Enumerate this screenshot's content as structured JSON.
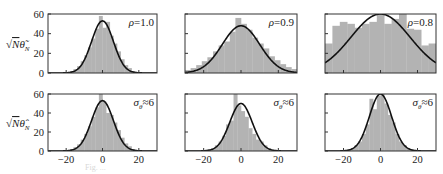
{
  "figure": {
    "ylabel_top": "√Nθ̃",
    "ylabel_top_sub": "N",
    "ylabel_bottom": "√Nθ̂",
    "ylabel_bottom_sub": "N",
    "yticks": [
      0,
      20,
      40,
      60
    ],
    "xticks": [
      -20,
      0,
      20
    ],
    "hist_color": "#b3b3b3",
    "curve_color": "#111111",
    "frame_color": "#333333"
  },
  "chart_data": [
    {
      "type": "bar",
      "title": "",
      "annotation": "ρ=1.0",
      "row": 0,
      "col": 0,
      "xlabel": "",
      "ylabel": "√N θ̃_N",
      "xlim": [
        -30,
        30
      ],
      "ylim": [
        0,
        60
      ],
      "show_xtick_labels": false,
      "bin_width": 2,
      "bin_centers": [
        -21,
        -19,
        -17,
        -15,
        -13,
        -11,
        -9,
        -7,
        -5,
        -3,
        -1,
        1,
        3,
        5,
        7,
        9,
        11,
        13,
        15,
        17,
        19,
        21
      ],
      "values": [
        0,
        1,
        2,
        4,
        7,
        12,
        18,
        26,
        35,
        45,
        58,
        46,
        52,
        38,
        30,
        22,
        14,
        8,
        5,
        2,
        1,
        0
      ],
      "fit_curve": {
        "type": "gaussian",
        "mean": 0,
        "sigma": 6,
        "peak": 53
      }
    },
    {
      "type": "bar",
      "annotation": "ρ=0.9",
      "row": 0,
      "col": 1,
      "xlim": [
        -30,
        30
      ],
      "ylim": [
        0,
        60
      ],
      "show_xtick_labels": false,
      "bin_width": 3,
      "bin_centers": [
        -28.5,
        -25.5,
        -22.5,
        -19.5,
        -16.5,
        -13.5,
        -10.5,
        -7.5,
        -4.5,
        -1.5,
        1.5,
        4.5,
        7.5,
        10.5,
        13.5,
        16.5,
        19.5,
        22.5,
        25.5,
        28.5
      ],
      "values": [
        3,
        5,
        8,
        12,
        16,
        22,
        28,
        32,
        42,
        56,
        50,
        44,
        36,
        30,
        25,
        17,
        13,
        9,
        6,
        4
      ],
      "fit_curve": {
        "type": "gaussian",
        "mean": 0,
        "sigma": 10,
        "peak": 48
      }
    },
    {
      "type": "bar",
      "annotation": "ρ=0.8",
      "row": 0,
      "col": 2,
      "xlim": [
        -30,
        30
      ],
      "ylim": [
        0,
        60
      ],
      "show_xtick_labels": false,
      "bin_width": 4,
      "bin_centers": [
        -28,
        -24,
        -20,
        -16,
        -12,
        -8,
        -4,
        0,
        4,
        8,
        12,
        16,
        20,
        24,
        28
      ],
      "values": [
        30,
        48,
        52,
        50,
        46,
        50,
        52,
        60,
        50,
        55,
        60,
        45,
        44,
        28,
        30
      ],
      "fit_curve": {
        "type": "gaussian",
        "mean": 0,
        "sigma": 16,
        "peak": 60
      }
    },
    {
      "type": "bar",
      "annotation": "σ_θ≈6",
      "row": 1,
      "col": 0,
      "ylabel": "√N θ̂_N",
      "xlim": [
        -30,
        30
      ],
      "ylim": [
        0,
        60
      ],
      "show_xtick_labels": true,
      "bin_width": 2,
      "bin_centers": [
        -21,
        -19,
        -17,
        -15,
        -13,
        -11,
        -9,
        -7,
        -5,
        -3,
        -1,
        1,
        3,
        5,
        7,
        9,
        11,
        13,
        15,
        17,
        19,
        21
      ],
      "values": [
        0,
        1,
        2,
        4,
        7,
        12,
        18,
        26,
        36,
        46,
        60,
        52,
        40,
        38,
        30,
        22,
        14,
        8,
        5,
        2,
        1,
        0
      ],
      "fit_curve": {
        "type": "gaussian",
        "mean": 0,
        "sigma": 6,
        "peak": 53
      }
    },
    {
      "type": "bar",
      "annotation": "σ_θ≈6",
      "row": 1,
      "col": 1,
      "xlim": [
        -30,
        30
      ],
      "ylim": [
        0,
        60
      ],
      "show_xtick_labels": true,
      "bin_width": 2,
      "bin_centers": [
        -21,
        -19,
        -17,
        -15,
        -13,
        -11,
        -9,
        -7,
        -5,
        -3,
        -1,
        1,
        3,
        5,
        7,
        9,
        11,
        13,
        15,
        17,
        19,
        21
      ],
      "values": [
        0,
        1,
        2,
        3,
        6,
        10,
        16,
        28,
        32,
        60,
        48,
        42,
        36,
        24,
        18,
        12,
        10,
        6,
        3,
        1,
        0,
        0
      ],
      "fit_curve": {
        "type": "gaussian",
        "mean": 0,
        "sigma": 6,
        "peak": 50
      }
    },
    {
      "type": "bar",
      "annotation": "σ_θ≈6",
      "row": 1,
      "col": 2,
      "xlim": [
        -30,
        30
      ],
      "ylim": [
        0,
        60
      ],
      "show_xtick_labels": true,
      "bin_width": 2,
      "bin_centers": [
        -19,
        -17,
        -15,
        -13,
        -11,
        -9,
        -7,
        -5,
        -3,
        -1,
        1,
        3,
        5,
        7,
        9,
        11,
        13,
        15,
        17,
        19
      ],
      "values": [
        0,
        1,
        3,
        6,
        10,
        18,
        28,
        55,
        44,
        58,
        60,
        50,
        38,
        30,
        18,
        10,
        6,
        3,
        1,
        0
      ],
      "fit_curve": {
        "type": "gaussian",
        "mean": 0,
        "sigma": 6,
        "peak": 60
      }
    }
  ],
  "caption": "Fig. ..."
}
